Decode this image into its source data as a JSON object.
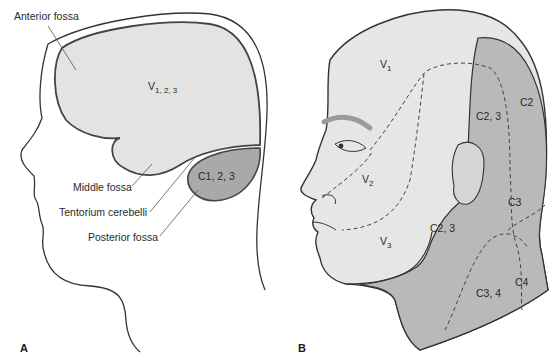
{
  "panels": [
    {
      "id": "A",
      "label": "A",
      "regions": {
        "supratentorial": {
          "label_main": "V",
          "label_sub": "1, 2, 3",
          "fill": "#e3e3e3"
        },
        "posterior": {
          "label": "C1, 2, 3",
          "fill": "#a9a9a9"
        }
      },
      "callouts": [
        "Anterior fossa",
        "Middle fossa",
        "Tentorium cerebelli",
        "Posterior fossa"
      ]
    },
    {
      "id": "B",
      "label": "B",
      "regions": {
        "v1": {
          "main": "V",
          "sub": "1"
        },
        "v2": {
          "main": "V",
          "sub": "2"
        },
        "v3": {
          "main": "V",
          "sub": "3"
        },
        "c2": "C2",
        "c23_top": "C2, 3",
        "c3": "C3",
        "c23_neck": "C2, 3",
        "c34": "C3, 4",
        "c4": "C4"
      },
      "colors": {
        "trigeminal": "#e6e6e6",
        "cervical": "#b9b9b9",
        "brow": "#9a9a9a"
      }
    }
  ]
}
